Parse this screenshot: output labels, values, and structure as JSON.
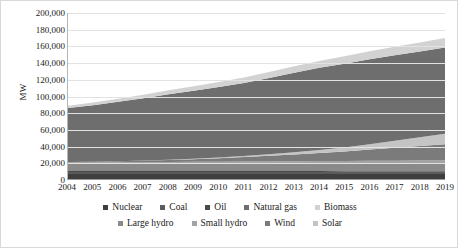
{
  "axes": {
    "ylabel": "MW",
    "yticks": [
      "0",
      "20,000",
      "40,000",
      "60,000",
      "80,000",
      "100,000",
      "120,000",
      "140,000",
      "160,000",
      "180,000",
      "200,000"
    ],
    "xticks": [
      "2004",
      "2005",
      "2006",
      "2007",
      "2008",
      "2009",
      "2010",
      "2011",
      "2012",
      "2013",
      "2014",
      "2015",
      "2016",
      "2017",
      "2018",
      "2019"
    ]
  },
  "legend": {
    "rows": [
      [
        {
          "label": "Nuclear",
          "color": "#3f3f3f"
        },
        {
          "label": "Coal",
          "color": "#5b5b5b"
        },
        {
          "label": "Oil",
          "color": "#4a4a4a"
        },
        {
          "label": "Natural gas",
          "color": "#6e6e6e"
        },
        {
          "label": "Biomass",
          "color": "#d2d2d2"
        }
      ],
      [
        {
          "label": "Large hydro",
          "color": "#8a8a8a"
        },
        {
          "label": "Small hydro",
          "color": "#a3a3a3"
        },
        {
          "label": "Wind",
          "color": "#7b7b7b"
        },
        {
          "label": "Solar",
          "color": "#c4c4c4"
        }
      ]
    ]
  },
  "chart_data": {
    "type": "area",
    "title": "",
    "xlabel": "",
    "ylabel": "MW",
    "ylim": [
      0,
      200000
    ],
    "grid": true,
    "stacked": true,
    "legend_position": "bottom",
    "x": [
      2004,
      2005,
      2006,
      2007,
      2008,
      2009,
      2010,
      2011,
      2012,
      2013,
      2014,
      2015,
      2016,
      2017,
      2018,
      2019
    ],
    "categories": [
      "2004",
      "2005",
      "2006",
      "2007",
      "2008",
      "2009",
      "2010",
      "2011",
      "2012",
      "2013",
      "2014",
      "2015",
      "2016",
      "2017",
      "2018",
      "2019"
    ],
    "series": [
      {
        "name": "Nuclear",
        "color": "#3f3f3f",
        "values": [
          6000,
          6000,
          6000,
          6000,
          6000,
          6000,
          6000,
          6000,
          6000,
          6000,
          6000,
          6000,
          6000,
          6000,
          6000,
          6000
        ]
      },
      {
        "name": "Coal",
        "color": "#5b5b5b",
        "values": [
          2500,
          2500,
          2500,
          2500,
          2500,
          2500,
          2500,
          2500,
          2500,
          2500,
          2500,
          2500,
          2500,
          2500,
          2500,
          2500
        ]
      },
      {
        "name": "Oil",
        "color": "#4a4a4a",
        "values": [
          1200,
          1200,
          1200,
          1200,
          1200,
          1100,
          1100,
          1100,
          1000,
          1000,
          1000,
          900,
          900,
          900,
          800,
          800
        ]
      },
      {
        "name": "Large hydro",
        "color": "#8a8a8a",
        "values": [
          8500,
          8600,
          8700,
          8800,
          8900,
          9000,
          9100,
          9200,
          9300,
          9400,
          9500,
          9600,
          9700,
          9800,
          9900,
          10000
        ]
      },
      {
        "name": "Small hydro",
        "color": "#a3a3a3",
        "values": [
          1600,
          1700,
          1800,
          1900,
          2000,
          2100,
          2200,
          2300,
          2400,
          2500,
          2600,
          2700,
          2800,
          2900,
          3000,
          3100
        ]
      },
      {
        "name": "Wind",
        "color": "#7b7b7b",
        "values": [
          600,
          900,
          1300,
          1800,
          2400,
          3200,
          4200,
          5400,
          6800,
          8200,
          9800,
          11500,
          13500,
          15500,
          17500,
          19500
        ]
      },
      {
        "name": "Solar",
        "color": "#c4c4c4",
        "values": [
          0,
          0,
          0,
          100,
          200,
          400,
          700,
          1100,
          1700,
          2500,
          3500,
          4800,
          6500,
          8500,
          10500,
          12500
        ]
      },
      {
        "name": "Natural gas",
        "color": "#6e6e6e",
        "values": [
          65000,
          68000,
          71500,
          75000,
          79000,
          82000,
          85000,
          88000,
          92000,
          96000,
          99000,
          101000,
          102500,
          103000,
          103500,
          104000
        ]
      },
      {
        "name": "Biomass",
        "color": "#d2d2d2",
        "values": [
          3000,
          3400,
          3800,
          4200,
          4800,
          5400,
          6000,
          6600,
          7200,
          7800,
          8400,
          9000,
          9600,
          10200,
          10800,
          11400
        ]
      }
    ],
    "stack_order": [
      "Nuclear",
      "Coal",
      "Oil",
      "Large hydro",
      "Small hydro",
      "Wind",
      "Solar",
      "Natural gas",
      "Biomass"
    ],
    "totals": [
      88400,
      92300,
      96800,
      101500,
      107000,
      111700,
      116800,
      122200,
      128900,
      135900,
      142300,
      148000,
      153500,
      158300,
      162500,
      166800
    ]
  }
}
